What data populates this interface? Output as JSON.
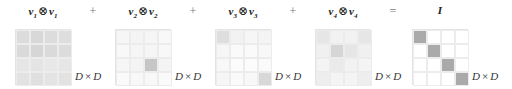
{
  "terms": [
    {
      "vec": "v",
      "index": "1",
      "label_sep": "⊗"
    },
    {
      "vec": "v",
      "index": "2",
      "label_sep": "⊗"
    },
    {
      "vec": "v",
      "index": "3",
      "label_sep": "⊗"
    },
    {
      "vec": "v",
      "index": "4",
      "label_sep": "⊗"
    }
  ],
  "result_label": "I",
  "operators": {
    "plus": "+",
    "equals": "="
  },
  "dim_label": {
    "left": "D",
    "times": "×",
    "right": "D"
  },
  "matrices": [
    {
      "name": "v1-outer-v1",
      "cells": [
        [
          "#dcdcdc",
          "#d8d8d8",
          "#dcdcdc",
          "#dedede"
        ],
        [
          "#dadada",
          "#d6d6d6",
          "#dadada",
          "#dcdcdc"
        ],
        [
          "#e6e6e6",
          "#e4e4e4",
          "#e8e8e8",
          "#e6e6e6"
        ],
        [
          "#e2e2e2",
          "#e0e0e0",
          "#e4e4e4",
          "#e2e2e2"
        ]
      ]
    },
    {
      "name": "v2-outer-v2",
      "cells": [
        [
          "#f6f6f6",
          "#f4f4f4",
          "#f6f6f6",
          "#f8f8f8"
        ],
        [
          "#f8f8f8",
          "#f6f6f6",
          "#f6f6f6",
          "#f8f8f8"
        ],
        [
          "#f6f6f6",
          "#f4f4f4",
          "#c6c6c6",
          "#f4f4f4"
        ],
        [
          "#fafafa",
          "#f8f8f8",
          "#f8f8f8",
          "#fafafa"
        ]
      ]
    },
    {
      "name": "v3-outer-v3",
      "cells": [
        [
          "#dedede",
          "#f2f2f2",
          "#f6f6f6",
          "#f4f4f4"
        ],
        [
          "#f6f6f6",
          "#fafafa",
          "#fafafa",
          "#f8f8f8"
        ],
        [
          "#f8f8f8",
          "#fcfcfc",
          "#fcfcfc",
          "#fafafa"
        ],
        [
          "#f6f6f6",
          "#fafafa",
          "#f8f8f8",
          "#d8d8d8"
        ]
      ]
    },
    {
      "name": "v4-outer-v4",
      "cells": [
        [
          "#e6e6e6",
          "#f2f2f2",
          "#f2f2f2",
          "#e6e6e6"
        ],
        [
          "#f0f0f0",
          "#d6d6d6",
          "#e6e6e6",
          "#f0f0f0"
        ],
        [
          "#f4f4f4",
          "#eaeaea",
          "#f2f2f2",
          "#f4f4f4"
        ],
        [
          "#eeeeee",
          "#f4f4f4",
          "#f4f4f4",
          "#eeeeee"
        ]
      ]
    },
    {
      "name": "identity",
      "cells": [
        [
          "#aaaaaa",
          "#ffffff",
          "#ffffff",
          "#ffffff"
        ],
        [
          "#ffffff",
          "#aaaaaa",
          "#ffffff",
          "#ffffff"
        ],
        [
          "#ffffff",
          "#ffffff",
          "#aaaaaa",
          "#ffffff"
        ],
        [
          "#ffffff",
          "#ffffff",
          "#ffffff",
          "#aaaaaa"
        ]
      ]
    }
  ]
}
